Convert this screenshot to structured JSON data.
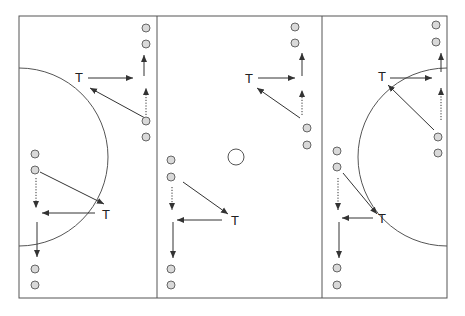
{
  "diagram": {
    "title": "",
    "colors": {
      "line": "#555555",
      "ball_fill": "#d9d9d9",
      "ball_stroke": "#666666",
      "arrow": "#333333"
    },
    "field": {
      "x": 19,
      "y": 16,
      "width": 428,
      "height": 282
    },
    "dividers": [
      157,
      322
    ],
    "arcs": [
      {
        "name": "left-circle",
        "cx": 19,
        "cy": 157,
        "r": 89,
        "side": "left"
      },
      {
        "name": "right-circle",
        "cx": 447,
        "cy": 157,
        "r": 89,
        "side": "right"
      }
    ],
    "center_spot": {
      "cx": 236,
      "cy": 157,
      "r": 8
    },
    "labels": [
      {
        "text": "T",
        "x": 75,
        "y": 82
      },
      {
        "text": "T",
        "x": 102,
        "y": 219
      },
      {
        "text": "T",
        "x": 245,
        "y": 83
      },
      {
        "text": "T",
        "x": 231,
        "y": 225
      },
      {
        "text": "T",
        "x": 378,
        "y": 81
      },
      {
        "text": "T",
        "x": 378,
        "y": 223
      }
    ],
    "balls": [
      [
        146,
        28
      ],
      [
        146,
        44
      ],
      [
        146,
        121
      ],
      [
        146,
        137
      ],
      [
        35,
        154
      ],
      [
        35,
        170
      ],
      [
        35,
        269
      ],
      [
        35,
        285
      ],
      [
        295,
        27
      ],
      [
        295,
        43
      ],
      [
        307,
        128
      ],
      [
        307,
        145
      ],
      [
        171,
        160
      ],
      [
        171,
        177
      ],
      [
        171,
        269
      ],
      [
        171,
        285
      ],
      [
        436,
        25
      ],
      [
        436,
        42
      ],
      [
        438,
        137
      ],
      [
        438,
        153
      ],
      [
        337,
        151
      ],
      [
        337,
        167
      ],
      [
        337,
        268
      ],
      [
        337,
        285
      ]
    ],
    "passes": [
      [
        88,
        78,
        133,
        78
      ],
      [
        145,
        118,
        90,
        88
      ],
      [
        144,
        76,
        144,
        55
      ],
      [
        40,
        172,
        104,
        204
      ],
      [
        95,
        213,
        42,
        213
      ],
      [
        37,
        222,
        37,
        257
      ],
      [
        258,
        78,
        295,
        78
      ],
      [
        300,
        118,
        257,
        88
      ],
      [
        302,
        76,
        302,
        53
      ],
      [
        183,
        182,
        228,
        214
      ],
      [
        222,
        220,
        177,
        220
      ],
      [
        173,
        222,
        173,
        258
      ],
      [
        390,
        78,
        432,
        78
      ],
      [
        434,
        130,
        388,
        85
      ],
      [
        441,
        72,
        441,
        53
      ],
      [
        343,
        173,
        377,
        214
      ],
      [
        373,
        218,
        342,
        218
      ],
      [
        339,
        222,
        339,
        258
      ]
    ],
    "runs": [
      [
        146,
        115,
        146,
        88
      ],
      [
        36,
        178,
        36,
        208
      ],
      [
        302,
        115,
        302,
        90
      ],
      [
        172,
        187,
        172,
        210
      ],
      [
        441,
        120,
        441,
        88
      ],
      [
        338,
        178,
        338,
        210
      ]
    ]
  }
}
